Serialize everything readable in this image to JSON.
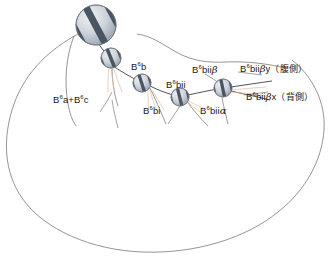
{
  "figure": {
    "type": "cell-lineage-diagram",
    "background_color": "#ffffff",
    "outline_color": "#6b6b6b",
    "neurite_color": "#4a4a4a",
    "faint_branch_color": "#e8c9b4",
    "nucleus_fill": "#c9ced6",
    "nucleus_stripe": "#4e5a66",
    "label_color": "#1a1a1a"
  },
  "labels": {
    "b6a_b6c": {
      "prefix": "B",
      "sup": "6",
      "text": "a+B",
      "sup2": "6",
      "tail": "c",
      "full": "B6a+B6c"
    },
    "b6b": {
      "prefix": "B",
      "sup": "6",
      "tail": "b",
      "full": "B6b"
    },
    "b6bi": {
      "prefix": "B",
      "sup": "6",
      "tail": "bi",
      "full": "B6bi"
    },
    "b6bii": {
      "prefix": "B",
      "sup": "6",
      "tail": "bii",
      "full": "B6bii"
    },
    "b6bii_alpha": {
      "prefix": "B",
      "sup": "6",
      "tail": "bii",
      "greek": "α",
      "full": "B6biiα"
    },
    "b6bii_beta": {
      "prefix": "B",
      "sup": "6",
      "tail": "bii",
      "greek": "β",
      "full": "B6biiβ"
    },
    "b6bii_beta_y": {
      "prefix": "B",
      "sup": "6",
      "tail": "bii",
      "greek": "β",
      "suffix": "y",
      "annotation": "（腹側）",
      "full": "B6biiβy（腹側）"
    },
    "b6bii_beta_x": {
      "prefix": "B",
      "sup": "6",
      "tail": "bii",
      "greek": "β",
      "suffix": "x",
      "annotation": "（背側）",
      "full": "B6biiβx（背側）"
    }
  },
  "cells": [
    {
      "name": "large-striped-nucleus",
      "cx": 96,
      "cy": 25,
      "r": 20,
      "stripes": 3
    },
    {
      "name": "nucleus-b6b-upper",
      "cx": 111,
      "cy": 58,
      "r": 10,
      "stripes": 3
    },
    {
      "name": "nucleus-b6b",
      "cx": 142,
      "cy": 83,
      "r": 9,
      "stripes": 3
    },
    {
      "name": "nucleus-b6bii",
      "cx": 180,
      "cy": 97,
      "r": 9,
      "stripes": 3
    },
    {
      "name": "nucleus-b6bii-beta",
      "cx": 223,
      "cy": 88,
      "r": 9,
      "stripes": 3
    }
  ]
}
